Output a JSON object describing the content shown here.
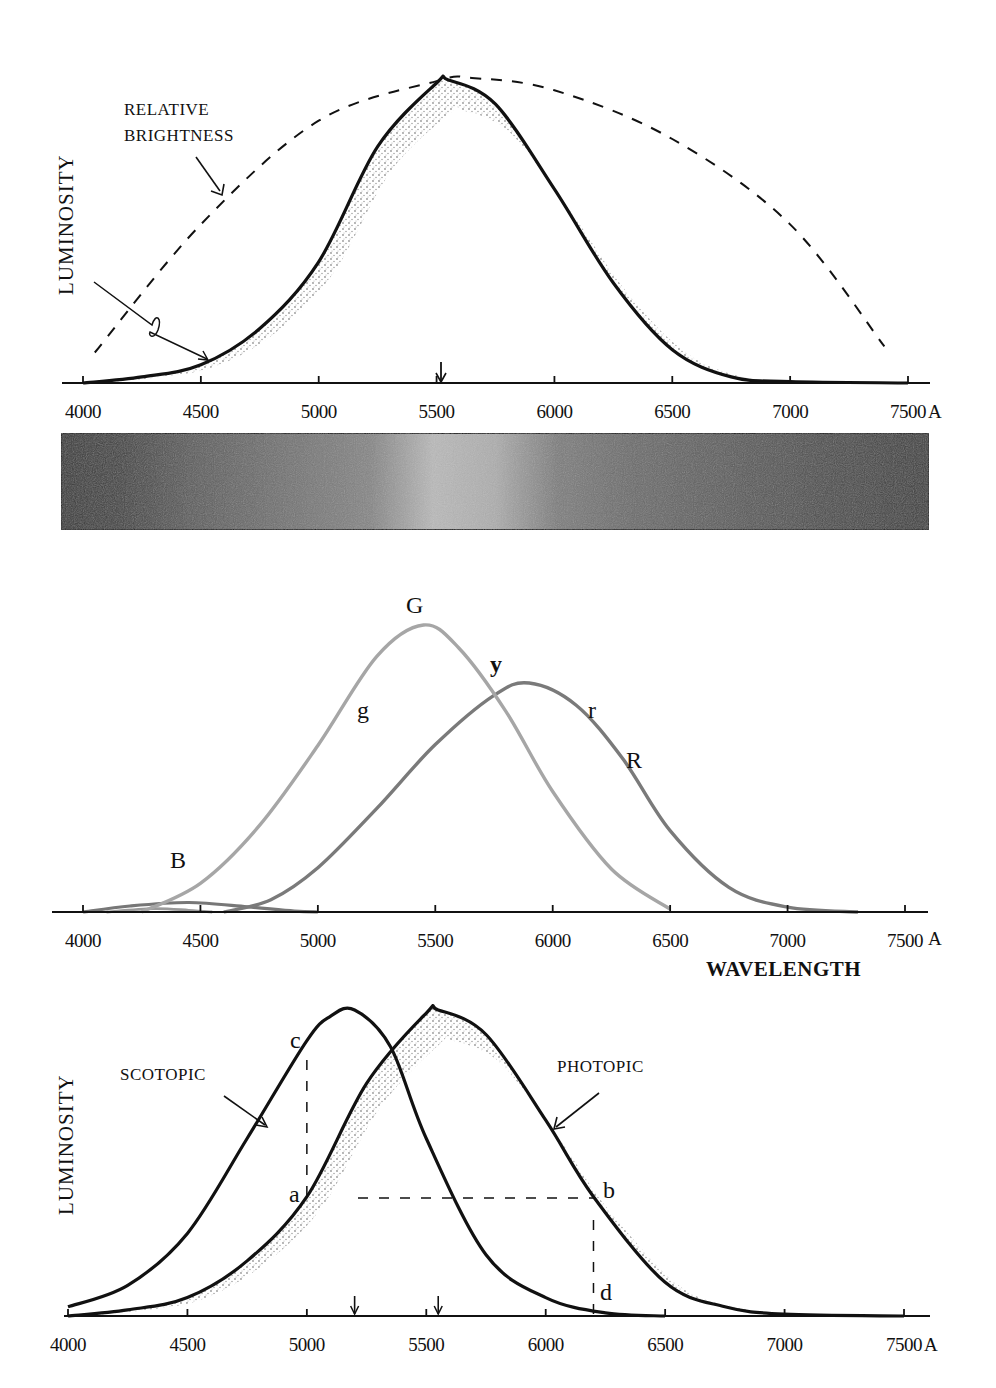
{
  "figure": {
    "unit_suffix": "A"
  },
  "chart_data": [
    {
      "type": "line",
      "title": "",
      "xlabel": "",
      "ylabel": "LUMINOSITY",
      "xlim": [
        3950,
        7600
      ],
      "ylim": [
        0,
        1.0
      ],
      "xticks": [
        4000,
        4500,
        5000,
        5500,
        6000,
        6500,
        7000,
        7500
      ],
      "xtick_labels": [
        "4000",
        "4500",
        "5000",
        "5500",
        "6000",
        "6500",
        "7000",
        "7500"
      ],
      "grid": false,
      "peak_marker_x": 5550,
      "annotations": [
        {
          "text_lines": [
            "RELATIVE",
            "BRIGHTNESS"
          ],
          "points_to": "dashed curve"
        },
        {
          "text_lines": [],
          "points_to": "photopic luminosity curve (lightning-style arrow)"
        }
      ],
      "series": [
        {
          "name": "Photopic luminosity",
          "style": "solid",
          "shaded_band": true,
          "x": [
            4000,
            4250,
            4500,
            4750,
            5000,
            5250,
            5500,
            5550,
            5750,
            6000,
            6250,
            6500,
            6750,
            7000,
            7500
          ],
          "y": [
            0.0,
            0.02,
            0.06,
            0.18,
            0.4,
            0.78,
            0.99,
            1.0,
            0.92,
            0.64,
            0.33,
            0.11,
            0.02,
            0.005,
            0.0
          ]
        },
        {
          "name": "Relative brightness",
          "style": "dashed",
          "x": [
            4050,
            4500,
            5000,
            5500,
            5650,
            6000,
            6500,
            7000,
            7400
          ],
          "y": [
            0.1,
            0.52,
            0.86,
            0.99,
            1.0,
            0.96,
            0.8,
            0.52,
            0.12
          ]
        }
      ]
    },
    {
      "type": "heatmap",
      "title": "",
      "description": "Grayscale spectrum band showing perceived brightness across wavelengths 4000-7500 A",
      "x": [
        4000,
        4250,
        4500,
        4750,
        5000,
        5250,
        5500,
        5750,
        6000,
        6250,
        6500,
        6750,
        7000,
        7250,
        7500
      ],
      "brightness": [
        0.12,
        0.18,
        0.3,
        0.38,
        0.45,
        0.52,
        0.78,
        0.72,
        0.48,
        0.4,
        0.35,
        0.3,
        0.25,
        0.2,
        0.15
      ]
    },
    {
      "type": "line",
      "title": "",
      "xlabel": "WAVELENGTH",
      "ylabel": "",
      "xlim": [
        3950,
        7600
      ],
      "ylim": [
        0,
        1.0
      ],
      "xticks": [
        4000,
        4500,
        5000,
        5500,
        6000,
        6500,
        7000,
        7500
      ],
      "xtick_labels": [
        "4000",
        "4500",
        "5000",
        "5500",
        "6000",
        "6500",
        "7000",
        "7500"
      ],
      "grid": false,
      "curve_labels": [
        {
          "text": "G",
          "near_x": 5450
        },
        {
          "text": "g",
          "near_x": 5220
        },
        {
          "text": "y",
          "near_x": 5780
        },
        {
          "text": "r",
          "near_x": 6150
        },
        {
          "text": "R",
          "near_x": 6300
        },
        {
          "text": "B",
          "near_x": 4450
        }
      ],
      "series": [
        {
          "name": "G",
          "color": "#a6a6a6",
          "x": [
            4250,
            4500,
            4750,
            5000,
            5250,
            5450,
            5600,
            5800,
            6000,
            6250,
            6500
          ],
          "y": [
            0.0,
            0.1,
            0.3,
            0.58,
            0.89,
            1.0,
            0.92,
            0.7,
            0.42,
            0.15,
            0.01
          ]
        },
        {
          "name": "R",
          "color": "#7a7a7a",
          "x": [
            4600,
            4800,
            5000,
            5250,
            5500,
            5750,
            5900,
            6100,
            6300,
            6500,
            6750,
            7000,
            7300
          ],
          "y": [
            0.0,
            0.05,
            0.18,
            0.42,
            0.68,
            0.88,
            0.93,
            0.84,
            0.62,
            0.33,
            0.1,
            0.02,
            0.0
          ]
        },
        {
          "name": "B",
          "color": "#777777",
          "x": [
            4000,
            4200,
            4450,
            4700,
            4900,
            5000
          ],
          "y": [
            0.0,
            0.07,
            0.11,
            0.06,
            0.01,
            0.0
          ]
        },
        {
          "name": "b (small blue-violet)",
          "color": "#9a9a9a",
          "x": [
            4100,
            4300,
            4450,
            4550
          ],
          "y": [
            0.0,
            0.04,
            0.02,
            0.0
          ]
        }
      ]
    },
    {
      "type": "line",
      "title": "",
      "xlabel": "",
      "ylabel": "LUMINOSITY",
      "xlim": [
        3950,
        7600
      ],
      "ylim": [
        0,
        1.0
      ],
      "xticks": [
        4000,
        4500,
        5000,
        5500,
        6000,
        6500,
        7000,
        7500
      ],
      "xtick_labels": [
        "4000",
        "4500",
        "5000",
        "5500",
        "6000",
        "6500",
        "7000",
        "7500"
      ],
      "grid": false,
      "peak_markers_x": [
        5200,
        5550
      ],
      "annotations": [
        {
          "text": "SCOTOPIC",
          "points_to": "scotopic curve"
        },
        {
          "text": "PHOTOPIC",
          "points_to": "photopic curve"
        }
      ],
      "reference_points": [
        {
          "label": "c",
          "x": 5000,
          "on": "scotopic"
        },
        {
          "label": "a",
          "x": 5000,
          "on": "photopic"
        },
        {
          "label": "b",
          "x": 6200,
          "on": "photopic"
        },
        {
          "label": "d",
          "x": 6200,
          "on": "scotopic"
        }
      ],
      "series": [
        {
          "name": "Scotopic",
          "style": "solid",
          "x": [
            4000,
            4250,
            4500,
            4750,
            5000,
            5100,
            5200,
            5350,
            5500,
            5750,
            6000,
            6250,
            6500
          ],
          "y": [
            0.03,
            0.1,
            0.27,
            0.58,
            0.9,
            0.98,
            1.0,
            0.88,
            0.58,
            0.2,
            0.06,
            0.01,
            0.0
          ]
        },
        {
          "name": "Photopic",
          "style": "solid",
          "shaded_band": true,
          "x": [
            4000,
            4250,
            4500,
            4750,
            5000,
            5250,
            5500,
            5550,
            5750,
            6000,
            6200,
            6500,
            6750,
            7000,
            7500
          ],
          "y": [
            0.0,
            0.02,
            0.06,
            0.18,
            0.39,
            0.76,
            0.99,
            1.0,
            0.92,
            0.64,
            0.39,
            0.11,
            0.03,
            0.006,
            0.0
          ]
        }
      ]
    }
  ]
}
